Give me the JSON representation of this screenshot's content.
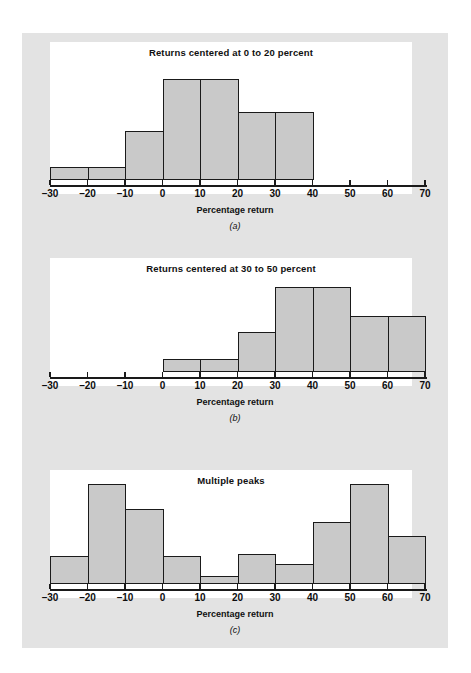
{
  "figure": {
    "background_color": "#e3e3e3",
    "panel_color": "#ffffff",
    "bar_fill_color": "#c9c9c9",
    "bar_edge_color": "#1a1a1a",
    "axis_title": "Percentage return"
  },
  "panels": [
    {
      "letter": "(a)",
      "title": "Returns centered at 0 to 20 percent",
      "axis_title": "Percentage return"
    },
    {
      "letter": "(b)",
      "title": "Returns centered at 30 to 50 percent",
      "axis_title": "Percentage return"
    },
    {
      "letter": "(c)",
      "title": "Multiple peaks",
      "axis_title": "Percentage return"
    }
  ],
  "chart_data": [
    {
      "type": "bar",
      "title": "Returns centered at 0 to 20 percent",
      "xlabel": "Percentage return",
      "ylabel": "",
      "xlim": [
        -30,
        70
      ],
      "xticks": [
        -30,
        -20,
        -10,
        0,
        10,
        20,
        30,
        40,
        50,
        60,
        70
      ],
      "xticklabels": [
        "-30",
        "-20",
        "-10",
        "0",
        "10",
        "20",
        "30",
        "40",
        "50",
        "60",
        "70"
      ],
      "grid": false,
      "legend": null,
      "bin_width": 10,
      "bin_starts": [
        -30,
        -20,
        -10,
        0,
        10,
        20,
        30,
        40,
        50,
        60
      ],
      "values": [
        13,
        13,
        49,
        101,
        101,
        68,
        68,
        0,
        0,
        0
      ],
      "ylim": [
        0,
        118
      ]
    },
    {
      "type": "bar",
      "title": "Returns centered at 30 to 50 percent",
      "xlabel": "Percentage return",
      "ylabel": "",
      "xlim": [
        -30,
        70
      ],
      "xticks": [
        -30,
        -20,
        -10,
        0,
        10,
        20,
        30,
        40,
        50,
        60,
        70
      ],
      "xticklabels": [
        "-30",
        "-20",
        "-10",
        "0",
        "10",
        "20",
        "30",
        "40",
        "50",
        "60",
        "70"
      ],
      "grid": false,
      "legend": null,
      "bin_width": 10,
      "bin_starts": [
        -30,
        -20,
        -10,
        0,
        10,
        20,
        30,
        40,
        50,
        60
      ],
      "values": [
        0,
        0,
        0,
        13,
        13,
        40,
        85,
        85,
        56,
        56
      ],
      "ylim": [
        0,
        100
      ]
    },
    {
      "type": "bar",
      "title": "Multiple peaks",
      "xlabel": "Percentage return",
      "ylabel": "",
      "xlim": [
        -30,
        70
      ],
      "xticks": [
        -30,
        -20,
        -10,
        0,
        10,
        20,
        30,
        40,
        50,
        60,
        70
      ],
      "xticklabels": [
        "-30",
        "-20",
        "-10",
        "0",
        "10",
        "20",
        "30",
        "40",
        "50",
        "60",
        "70"
      ],
      "grid": false,
      "legend": null,
      "bin_width": 10,
      "bin_starts": [
        -30,
        -20,
        -10,
        0,
        10,
        20,
        30,
        40,
        50,
        60
      ],
      "values": [
        28,
        100,
        75,
        28,
        8,
        30,
        20,
        62,
        100,
        48
      ],
      "ylim": [
        0,
        100
      ]
    }
  ]
}
